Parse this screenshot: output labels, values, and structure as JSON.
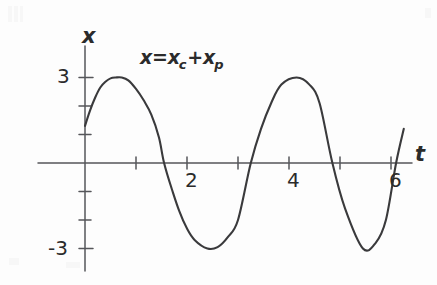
{
  "figure": {
    "kind": "hand-drawn-plot",
    "background_color": "#fdfdfd",
    "ink_color": "#2b2b2b",
    "axis_color": "#55565a"
  },
  "annotation": {
    "equation_prefix": "x=x",
    "equation_sub_1": "c",
    "equation_plus": "+x",
    "equation_sub_2": "p",
    "equation_full": "x=x_c+x_p"
  },
  "axes": {
    "x_axis_name": "t",
    "y_axis_name": "x",
    "x_tick_labels": [
      "2",
      "4",
      "6"
    ],
    "y_tick_labels": [
      "3",
      "-3"
    ]
  },
  "chart_data": {
    "type": "line",
    "title": "",
    "subtitle": "",
    "annotations": [
      "x=x_c+x_p"
    ],
    "xlabel": "t",
    "ylabel": "x",
    "xlim": [
      0,
      6.4
    ],
    "ylim": [
      -3.6,
      3.6
    ],
    "grid": false,
    "legend": null,
    "xticks": [
      1,
      2,
      3,
      4,
      5,
      6
    ],
    "xticklabels": [
      "",
      "2",
      "",
      "4",
      "",
      "6"
    ],
    "yticks": [
      -3,
      -1.5,
      0,
      1.5,
      3
    ],
    "yticklabels": [
      "-3",
      "",
      "",
      "",
      "3"
    ],
    "series": [
      {
        "name": "x=x_c+x_p",
        "description": "sinusoid of amplitude 3, period about 3.45 t-units, starting near x=1.3 at t=0",
        "amplitude": 3,
        "period": 3.45,
        "phase_value_at_t0": 1.3,
        "peaks": [
          {
            "t": 0.72,
            "x": 3
          },
          {
            "t": 4.15,
            "x": 3
          }
        ],
        "troughs": [
          {
            "t": 2.4,
            "x": -3
          },
          {
            "t": 5.45,
            "x": -3
          }
        ],
        "zero_crossings": [
          1.55,
          3.25,
          4.85,
          6.1
        ],
        "x": [
          0,
          0.1,
          0.2,
          0.3,
          0.4,
          0.5,
          0.6,
          0.72,
          0.85,
          1.0,
          1.15,
          1.3,
          1.45,
          1.55,
          1.7,
          1.85,
          2.0,
          2.15,
          2.4,
          2.6,
          2.8,
          3.0,
          3.25,
          3.45,
          3.65,
          3.85,
          4.15,
          4.4,
          4.6,
          4.85,
          5.1,
          5.45,
          5.7,
          5.9,
          6.1,
          6.25
        ],
        "y": [
          1.3,
          1.85,
          2.3,
          2.65,
          2.85,
          2.97,
          3.0,
          3.0,
          2.9,
          2.6,
          2.2,
          1.7,
          0.9,
          0.0,
          -0.9,
          -1.7,
          -2.3,
          -2.7,
          -3.0,
          -2.95,
          -2.6,
          -2.0,
          0.0,
          1.2,
          2.1,
          2.75,
          3.0,
          2.75,
          2.1,
          0.0,
          -1.6,
          -3.0,
          -2.8,
          -2.0,
          0.0,
          1.2
        ]
      }
    ]
  }
}
